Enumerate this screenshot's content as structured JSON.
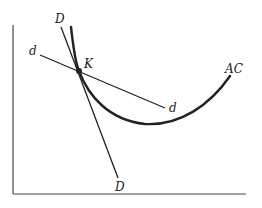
{
  "figure": {
    "type": "economics-cost-demand-diagram",
    "labels": {
      "D_top": "D",
      "D_bottom": "D",
      "d_left": "d",
      "d_right": "d",
      "K": "K",
      "AC": "AC"
    },
    "curves": [
      {
        "name": "DD",
        "kind": "line",
        "description": "steep demand line"
      },
      {
        "name": "dd",
        "kind": "line",
        "description": "flatter demand line"
      },
      {
        "name": "AC",
        "kind": "u-shaped curve",
        "description": "average cost curve tangent region at K"
      }
    ],
    "point": {
      "name": "K",
      "description": "intersection of DD, dd and AC"
    },
    "colors": {
      "line": "#222222",
      "axis": "#444444",
      "background": "#ffffff"
    }
  }
}
